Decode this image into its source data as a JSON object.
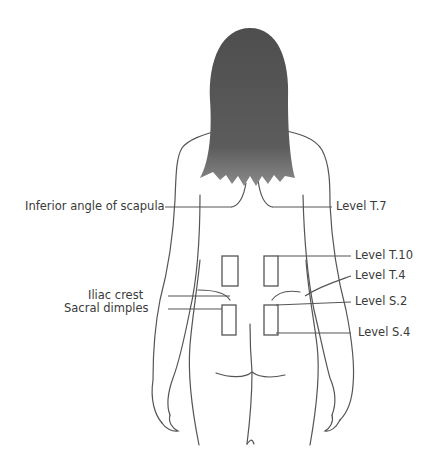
{
  "figure": {
    "labels_left": [
      {
        "id": "inferior-angle-scapula",
        "text": "Inferior angle of scapula"
      },
      {
        "id": "iliac-crest",
        "text": "Iliac crest"
      },
      {
        "id": "sacral-dimples",
        "text": "Sacral dimples"
      }
    ],
    "labels_right": [
      {
        "id": "level-t7",
        "text": "Level T.7"
      },
      {
        "id": "level-t10",
        "text": "Level T.10"
      },
      {
        "id": "level-t4",
        "text": "Level T.4"
      },
      {
        "id": "level-s2",
        "text": "Level S.2"
      },
      {
        "id": "level-s4",
        "text": "Level S.4"
      }
    ],
    "colors": {
      "line": "#555555",
      "hair": "#5a5a5a",
      "text": "#3a3a3a",
      "background": "#ffffff"
    }
  }
}
